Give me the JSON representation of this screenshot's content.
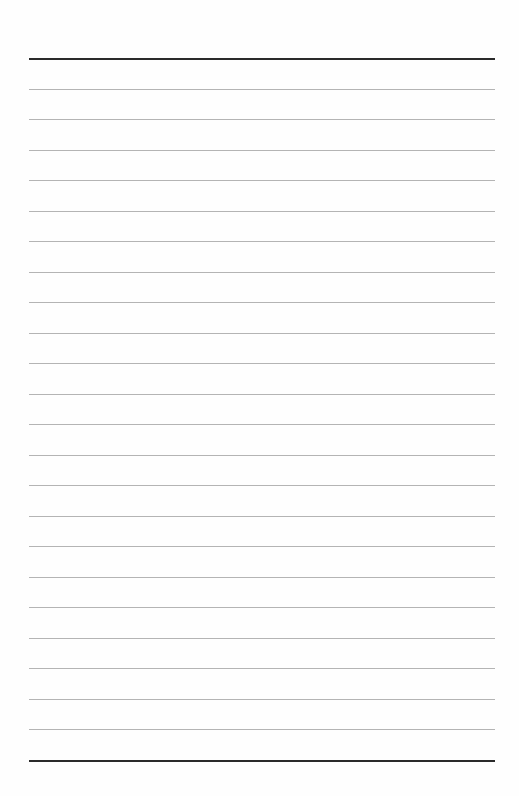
{
  "page": {
    "type": "lined-paper",
    "background_color": "#fefefe",
    "rule_color": "#b4b4b4",
    "border_rule_color": "#2a2a2a",
    "margin_left_px": 29,
    "margin_right_px": 494,
    "top_rule_y": 58,
    "bottom_rule_y": 760,
    "line_spacing_px": 30.5,
    "thin_rule_count": 22,
    "total_rule_count": 24
  }
}
